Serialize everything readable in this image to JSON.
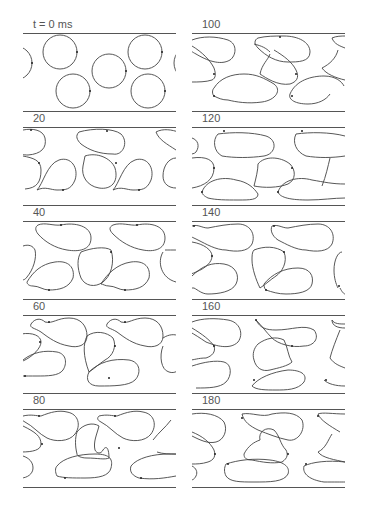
{
  "figure": {
    "caption_label_unit": "ms",
    "panels": [
      {
        "label": "t = 0 ms",
        "time_ms": 0,
        "column": 0,
        "row": 0
      },
      {
        "label": "20",
        "time_ms": 20,
        "column": 0,
        "row": 1
      },
      {
        "label": "40",
        "time_ms": 40,
        "column": 0,
        "row": 2
      },
      {
        "label": "60",
        "time_ms": 60,
        "column": 0,
        "row": 3
      },
      {
        "label": "80",
        "time_ms": 80,
        "column": 0,
        "row": 4
      },
      {
        "label": "100",
        "time_ms": 100,
        "column": 1,
        "row": 0
      },
      {
        "label": "120",
        "time_ms": 120,
        "column": 1,
        "row": 1
      },
      {
        "label": "140",
        "time_ms": 140,
        "column": 1,
        "row": 2
      },
      {
        "label": "160",
        "time_ms": 160,
        "column": 1,
        "row": 3
      },
      {
        "label": "180",
        "time_ms": 180,
        "column": 1,
        "row": 4
      }
    ]
  }
}
